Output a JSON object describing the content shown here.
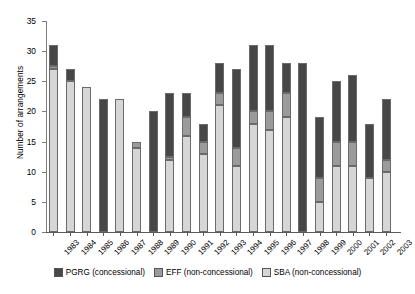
{
  "chart_data": {
    "type": "bar",
    "title": "",
    "xlabel": "",
    "ylabel": "Number of arrangements",
    "ylim": [
      0,
      35
    ],
    "yticks": [
      0,
      5,
      10,
      15,
      20,
      25,
      30,
      35
    ],
    "grid": false,
    "stacked": true,
    "legend_position": "bottom",
    "categories": [
      "1983",
      "1984",
      "1985",
      "1986",
      "1987",
      "1988",
      "1989",
      "1990",
      "1991",
      "1992",
      "1993",
      "1994",
      "1995",
      "1996",
      "1997",
      "1998",
      "1999",
      "2000",
      "2001",
      "2002",
      "2003"
    ],
    "series": [
      {
        "name": "SBA (non-concessional)",
        "color": "#d6d6d6",
        "values": [
          27,
          25,
          24,
          0,
          22,
          14,
          0,
          12,
          16,
          13,
          21,
          11,
          18,
          17,
          19,
          0,
          5,
          11,
          11,
          9,
          10
        ]
      },
      {
        "name": "EFF (non-concessional)",
        "color": "#9b9b9b",
        "values": [
          0.5,
          0,
          0,
          0,
          0,
          1,
          0,
          0.5,
          3,
          2,
          2,
          3,
          2,
          3,
          4,
          0,
          4,
          4,
          4,
          0,
          2
        ]
      },
      {
        "name": "PGRG (concessional)",
        "color": "#474747",
        "values": [
          3.5,
          2,
          0,
          22,
          0,
          0,
          20,
          10.5,
          4,
          3,
          5,
          13,
          11,
          11,
          5,
          28,
          10,
          10,
          11,
          9,
          10
        ]
      }
    ],
    "totals": [
      31,
      27,
      24,
      22,
      22,
      15,
      20,
      23,
      23,
      18,
      28,
      27,
      31,
      31,
      28,
      28,
      19,
      25,
      26,
      18,
      22
    ]
  },
  "legend": {
    "items": [
      {
        "label": "PGRG (concessional)",
        "key": "pgrg"
      },
      {
        "label": "EFF (non-concessional)",
        "key": "eff"
      },
      {
        "label": "SBA (non-concessional)",
        "key": "sba"
      }
    ]
  }
}
